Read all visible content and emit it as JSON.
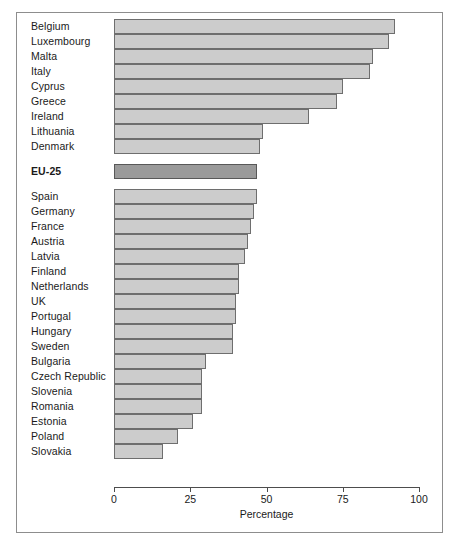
{
  "chart_data": {
    "type": "bar",
    "orientation": "horizontal",
    "title": "",
    "xlabel": "Percentage",
    "ylabel": "",
    "xlim": [
      0,
      100
    ],
    "xticks": [
      0,
      25,
      50,
      75,
      100
    ],
    "xtick_labels": [
      "0",
      "25",
      "50",
      "75",
      "100"
    ],
    "grid": false,
    "legend": null,
    "colors": {
      "bar_fill": "#cccccc",
      "bar_stroke": "#6e6e6e",
      "highlight_fill": "#9a9a9a",
      "highlight_stroke": "#585858",
      "frame": "#8d8d8d",
      "axis": "#4d4d4d",
      "text": "#1a1a1a",
      "background": "#ffffff"
    },
    "categories": [
      "Belgium",
      "Luxembourg",
      "Malta",
      "Italy",
      "Cyprus",
      "Greece",
      "Ireland",
      "Lithuania",
      "Denmark",
      "EU-25",
      "Spain",
      "Germany",
      "France",
      "Austria",
      "Latvia",
      "Finland",
      "Netherlands",
      "UK",
      "Portugal",
      "Hungary",
      "Sweden",
      "Bulgaria",
      "Czech Republic",
      "Slovenia",
      "Romania",
      "Estonia",
      "Poland",
      "Slovakia"
    ],
    "values": [
      92,
      90,
      85,
      84,
      75,
      73,
      64,
      49,
      48,
      47,
      47,
      46,
      45,
      44,
      43,
      41,
      41,
      40,
      40,
      39,
      39,
      30,
      29,
      29,
      29,
      26,
      21,
      16
    ],
    "bars": [
      {
        "label": "Belgium",
        "value": 92,
        "highlight": false,
        "group": "above"
      },
      {
        "label": "Luxembourg",
        "value": 90,
        "highlight": false,
        "group": "above"
      },
      {
        "label": "Malta",
        "value": 85,
        "highlight": false,
        "group": "above"
      },
      {
        "label": "Italy",
        "value": 84,
        "highlight": false,
        "group": "above"
      },
      {
        "label": "Cyprus",
        "value": 75,
        "highlight": false,
        "group": "above"
      },
      {
        "label": "Greece",
        "value": 73,
        "highlight": false,
        "group": "above"
      },
      {
        "label": "Ireland",
        "value": 64,
        "highlight": false,
        "group": "above"
      },
      {
        "label": "Lithuania",
        "value": 49,
        "highlight": false,
        "group": "above"
      },
      {
        "label": "Denmark",
        "value": 48,
        "highlight": false,
        "group": "above"
      },
      {
        "label": "EU-25",
        "value": 47,
        "highlight": true,
        "group": "average"
      },
      {
        "label": "Spain",
        "value": 47,
        "highlight": false,
        "group": "below"
      },
      {
        "label": "Germany",
        "value": 46,
        "highlight": false,
        "group": "below"
      },
      {
        "label": "France",
        "value": 45,
        "highlight": false,
        "group": "below"
      },
      {
        "label": "Austria",
        "value": 44,
        "highlight": false,
        "group": "below"
      },
      {
        "label": "Latvia",
        "value": 43,
        "highlight": false,
        "group": "below"
      },
      {
        "label": "Finland",
        "value": 41,
        "highlight": false,
        "group": "below"
      },
      {
        "label": "Netherlands",
        "value": 41,
        "highlight": false,
        "group": "below"
      },
      {
        "label": "UK",
        "value": 40,
        "highlight": false,
        "group": "below"
      },
      {
        "label": "Portugal",
        "value": 40,
        "highlight": false,
        "group": "below"
      },
      {
        "label": "Hungary",
        "value": 39,
        "highlight": false,
        "group": "below"
      },
      {
        "label": "Sweden",
        "value": 39,
        "highlight": false,
        "group": "below"
      },
      {
        "label": "Bulgaria",
        "value": 30,
        "highlight": false,
        "group": "below"
      },
      {
        "label": "Czech Republic",
        "value": 29,
        "highlight": false,
        "group": "below"
      },
      {
        "label": "Slovenia",
        "value": 29,
        "highlight": false,
        "group": "below"
      },
      {
        "label": "Romania",
        "value": 29,
        "highlight": false,
        "group": "below"
      },
      {
        "label": "Estonia",
        "value": 26,
        "highlight": false,
        "group": "below"
      },
      {
        "label": "Poland",
        "value": 21,
        "highlight": false,
        "group": "below"
      },
      {
        "label": "Slovakia",
        "value": 16,
        "highlight": false,
        "group": "below"
      }
    ]
  }
}
